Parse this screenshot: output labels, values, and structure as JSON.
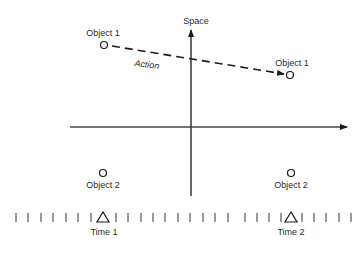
{
  "diagram": {
    "axes": {
      "vertical_label": "Space",
      "horizontal_arrow": true
    },
    "objects": [
      {
        "label": "Object 1",
        "position": "top-left",
        "time": "Time 1"
      },
      {
        "label": "Object 1",
        "position": "top-right",
        "time": "Time 2"
      },
      {
        "label": "Object 2",
        "position": "bottom-left",
        "time": "Time 1"
      },
      {
        "label": "Object 2",
        "position": "bottom-right",
        "time": "Time 2"
      }
    ],
    "action_label": "Action",
    "timeline": {
      "markers": [
        {
          "label": "Time 1"
        },
        {
          "label": "Time 2"
        }
      ],
      "tick_count": 27
    },
    "colors": {
      "line": "#1a1a1a",
      "text": "#2a2a2a",
      "background": "#ffffff"
    }
  }
}
